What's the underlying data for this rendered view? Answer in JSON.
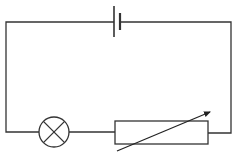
{
  "diagram": {
    "type": "circuit",
    "title": "",
    "components": [
      {
        "id": "cell",
        "kind": "battery-cell",
        "label": ""
      },
      {
        "id": "lamp",
        "kind": "lamp",
        "label": ""
      },
      {
        "id": "rheostat",
        "kind": "variable-resistor",
        "label": ""
      }
    ],
    "connections": [
      [
        "cell",
        "rheostat"
      ],
      [
        "rheostat",
        "lamp"
      ],
      [
        "lamp",
        "cell"
      ]
    ],
    "colors": {
      "wire": "#333333",
      "background": "#ffffff"
    }
  }
}
